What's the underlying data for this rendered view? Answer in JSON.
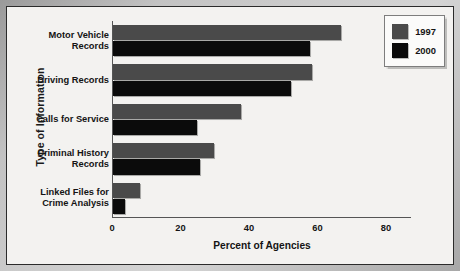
{
  "chart_data": {
    "type": "bar",
    "orientation": "horizontal",
    "title": "",
    "xlabel": "Percent of Agencies",
    "ylabel": "Type of Information",
    "xlim": [
      0,
      80
    ],
    "xticks": [
      0,
      20,
      40,
      60,
      80
    ],
    "grid": false,
    "legend_position": "top-right",
    "categories": [
      "Motor Vehicle\nRecords",
      "Driving Records",
      "Calls for Service",
      "Criminal History\nRecords",
      "Linked Files for\nCrime Analysis"
    ],
    "series": [
      {
        "name": "1997",
        "color": "#4a4a4a",
        "values": [
          66.5,
          58,
          37.5,
          29.5,
          8
        ]
      },
      {
        "name": "2000",
        "color": "#0b0b0b",
        "values": [
          57.5,
          52,
          24.5,
          25.5,
          3.5
        ]
      }
    ]
  },
  "legend": {
    "items": [
      {
        "label": "1997",
        "swatch": "legend-swatch-1997"
      },
      {
        "label": "2000",
        "swatch": "legend-swatch-2000"
      }
    ]
  },
  "axes": {
    "x_title": "Percent of Agencies",
    "y_title": "Type of Information",
    "x_tick_labels": [
      "0",
      "20",
      "40",
      "60",
      "80"
    ]
  }
}
